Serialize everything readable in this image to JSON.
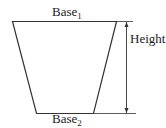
{
  "diagram": {
    "shape": "trapezoid",
    "labels": {
      "top_base": "Base",
      "top_base_subscript": "1",
      "bottom_base": "Base",
      "bottom_base_subscript": "2",
      "height": "Height"
    },
    "colors": {
      "line": "#333333",
      "text": "#222222",
      "background": "#ffffff"
    }
  }
}
